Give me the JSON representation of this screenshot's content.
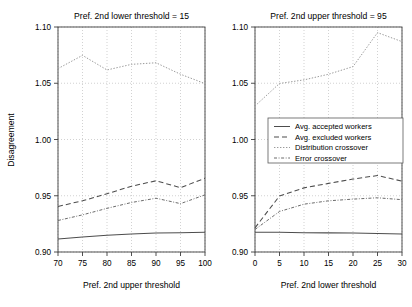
{
  "figure": {
    "ylabel": "Disagreement",
    "legend": {
      "position": "center-right",
      "entries": [
        {
          "label": "Avg. accepted workers",
          "style": "solid",
          "color": "#4d4d4d"
        },
        {
          "label": "Avg. excluded workers",
          "style": "dashed",
          "color": "#4d4d4d"
        },
        {
          "label": "Distribution crossover",
          "style": "dotted",
          "color": "#9a9a9a"
        },
        {
          "label": "Error crossover",
          "style": "dashdot",
          "color": "#6b6b6b"
        }
      ]
    }
  },
  "chart_data": [
    {
      "type": "line",
      "panel": "left",
      "title": "Pref. 2nd lower threshold = 15",
      "xlabel": "Pref. 2nd upper threshold",
      "ylabel": "Disagreement",
      "x": [
        70,
        75,
        80,
        85,
        90,
        95,
        100
      ],
      "xlim": [
        70,
        100
      ],
      "ylim": [
        0.9,
        1.1
      ],
      "xticks": [
        70,
        75,
        80,
        85,
        90,
        95,
        100
      ],
      "yticks": [
        0.9,
        0.95,
        1.0,
        1.05,
        1.1
      ],
      "xtick_labels": [
        "70",
        "75",
        "80",
        "85",
        "90",
        "95",
        "100"
      ],
      "ytick_labels": [
        "0.90",
        "0.95",
        "1.00",
        "1.05",
        "1.10"
      ],
      "grid": true,
      "series": [
        {
          "name": "Avg. accepted workers",
          "values": [
            0.9115,
            0.9133,
            0.9148,
            0.916,
            0.9168,
            0.9172,
            0.9175
          ]
        },
        {
          "name": "Avg. excluded workers",
          "values": [
            0.9405,
            0.9455,
            0.9518,
            0.9585,
            0.9633,
            0.9572,
            0.9655
          ]
        },
        {
          "name": "Distribution crossover",
          "values": [
            1.063,
            1.0748,
            1.0618,
            1.0668,
            1.0682,
            1.058,
            1.0497
          ]
        },
        {
          "name": "Error crossover",
          "values": [
            0.928,
            0.933,
            0.9388,
            0.944,
            0.9478,
            0.943,
            0.9508
          ]
        }
      ]
    },
    {
      "type": "line",
      "panel": "right",
      "title": "Pref. 2nd upper threshold = 95",
      "xlabel": "Pref. 2nd lower threshold",
      "ylabel": "Disagreement",
      "x": [
        0,
        5,
        10,
        15,
        20,
        25,
        30
      ],
      "xlim": [
        0,
        30
      ],
      "ylim": [
        0.9,
        1.1
      ],
      "xticks": [
        0,
        5,
        10,
        15,
        20,
        25,
        30
      ],
      "yticks": [
        0.9,
        0.95,
        1.0,
        1.05,
        1.1
      ],
      "xtick_labels": [
        "0",
        "5",
        "10",
        "15",
        "20",
        "25",
        "30"
      ],
      "ytick_labels": [
        "0.90",
        "0.95",
        "1.00",
        "1.05",
        "1.10"
      ],
      "grid": true,
      "series": [
        {
          "name": "Avg. accepted workers",
          "values": [
            0.9175,
            0.9175,
            0.9172,
            0.917,
            0.9168,
            0.9165,
            0.916
          ]
        },
        {
          "name": "Avg. excluded workers",
          "values": [
            0.9215,
            0.9498,
            0.957,
            0.961,
            0.9648,
            0.968,
            0.963
          ]
        },
        {
          "name": "Distribution crossover",
          "values": [
            1.0298,
            1.0498,
            1.053,
            1.058,
            1.0648,
            1.095,
            1.087
          ]
        },
        {
          "name": "Error crossover",
          "values": [
            0.92,
            0.936,
            0.9425,
            0.9455,
            0.947,
            0.9482,
            0.9465
          ]
        }
      ]
    }
  ]
}
